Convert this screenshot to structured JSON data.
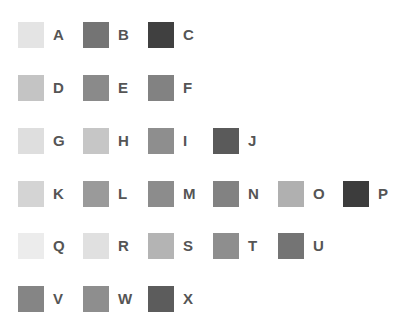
{
  "swatches": [
    {
      "label": "A",
      "color": "#e4e4e4",
      "row": 0,
      "col": 0
    },
    {
      "label": "B",
      "color": "#747474",
      "row": 0,
      "col": 1
    },
    {
      "label": "C",
      "color": "#404040",
      "row": 0,
      "col": 2
    },
    {
      "label": "D",
      "color": "#c4c4c4",
      "row": 1,
      "col": 0
    },
    {
      "label": "E",
      "color": "#8a8a8a",
      "row": 1,
      "col": 1
    },
    {
      "label": "F",
      "color": "#828282",
      "row": 1,
      "col": 2
    },
    {
      "label": "G",
      "color": "#dedede",
      "row": 2,
      "col": 0
    },
    {
      "label": "H",
      "color": "#c6c6c6",
      "row": 2,
      "col": 1
    },
    {
      "label": "I",
      "color": "#8e8e8e",
      "row": 2,
      "col": 2
    },
    {
      "label": "J",
      "color": "#5a5a5a",
      "row": 2,
      "col": 3
    },
    {
      "label": "K",
      "color": "#d4d4d4",
      "row": 3,
      "col": 0
    },
    {
      "label": "L",
      "color": "#9a9a9a",
      "row": 3,
      "col": 1
    },
    {
      "label": "M",
      "color": "#8c8c8c",
      "row": 3,
      "col": 2
    },
    {
      "label": "N",
      "color": "#828282",
      "row": 3,
      "col": 3
    },
    {
      "label": "O",
      "color": "#b0b0b0",
      "row": 3,
      "col": 4
    },
    {
      "label": "P",
      "color": "#3c3c3c",
      "row": 3,
      "col": 5
    },
    {
      "label": "Q",
      "color": "#ececec",
      "row": 4,
      "col": 0
    },
    {
      "label": "R",
      "color": "#e0e0e0",
      "row": 4,
      "col": 1
    },
    {
      "label": "S",
      "color": "#b4b4b4",
      "row": 4,
      "col": 2
    },
    {
      "label": "T",
      "color": "#8e8e8e",
      "row": 4,
      "col": 3
    },
    {
      "label": "U",
      "color": "#747474",
      "row": 4,
      "col": 4
    },
    {
      "label": "V",
      "color": "#858585",
      "row": 5,
      "col": 0
    },
    {
      "label": "W",
      "color": "#8e8e8e",
      "row": 5,
      "col": 1
    },
    {
      "label": "X",
      "color": "#5c5c5c",
      "row": 5,
      "col": 2
    }
  ]
}
